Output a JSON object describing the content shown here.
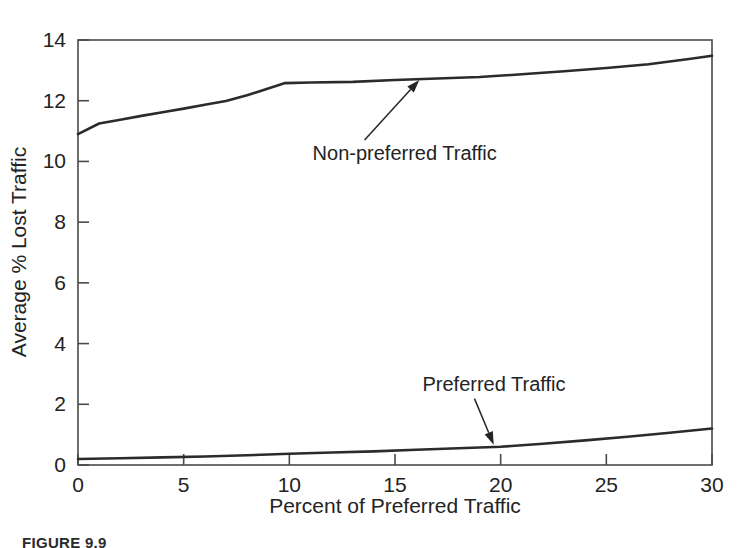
{
  "figure": {
    "caption": "FIGURE 9.9",
    "background_color": "#ffffff",
    "line_color": "#2b2b2b",
    "axis_color": "#4a4a4a",
    "text_color": "#232323"
  },
  "chart_data": {
    "type": "line",
    "title": "",
    "subtitle": "",
    "xlabel": "Percent of Preferred Traffic",
    "ylabel": "Average % Lost Traffic",
    "xlim": [
      0,
      30
    ],
    "ylim": [
      0,
      14
    ],
    "xticks": [
      0,
      5,
      10,
      15,
      20,
      25,
      30
    ],
    "yticks": [
      0,
      2,
      4,
      6,
      8,
      10,
      12,
      14
    ],
    "xtick_labels": [
      "0",
      "5",
      "10",
      "15",
      "20",
      "25",
      "30"
    ],
    "ytick_labels": [
      "0",
      "2",
      "4",
      "6",
      "8",
      "10",
      "12",
      "14"
    ],
    "grid": false,
    "legend": "none",
    "frame": "box",
    "series": [
      {
        "name": "Non-preferred Traffic",
        "x": [
          0,
          1,
          2,
          3,
          4,
          5,
          6,
          7,
          8,
          9,
          9.8,
          11,
          13,
          15,
          17,
          19,
          21,
          23,
          25,
          27,
          29,
          30
        ],
        "values": [
          10.9,
          11.25,
          11.37,
          11.5,
          11.62,
          11.74,
          11.87,
          11.99,
          12.18,
          12.4,
          12.58,
          12.6,
          12.62,
          12.68,
          12.73,
          12.78,
          12.87,
          12.97,
          13.08,
          13.2,
          13.38,
          13.48
        ]
      },
      {
        "name": "Preferred Traffic",
        "x": [
          0,
          2,
          4,
          6,
          8,
          10,
          12,
          14,
          16,
          18,
          20,
          22,
          24,
          26,
          28,
          30
        ],
        "values": [
          0.2,
          0.22,
          0.25,
          0.28,
          0.32,
          0.37,
          0.41,
          0.45,
          0.5,
          0.55,
          0.6,
          0.7,
          0.81,
          0.93,
          1.06,
          1.2
        ]
      }
    ],
    "annotations": [
      {
        "text": "Non-preferred Traffic",
        "label_x": 11.1,
        "label_y": 10.05,
        "point_x": 16.2,
        "point_y": 12.72
      },
      {
        "text": "Preferred Traffic",
        "label_x": 16.3,
        "label_y": 2.45,
        "point_x": 19.7,
        "point_y": 0.62
      }
    ]
  }
}
